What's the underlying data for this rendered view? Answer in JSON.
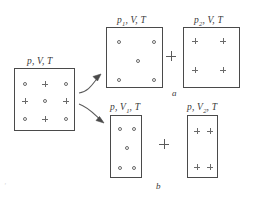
{
  "figure": {
    "kind": "physics-diagram",
    "background_color": "#ffffff",
    "line_color": "#4a4a4a",
    "particle_color": "#6a6a6a",
    "case_labels": [
      {
        "id": "a",
        "text": "a",
        "x": 172,
        "y": 93
      },
      {
        "id": "b",
        "text": "b",
        "x": 156,
        "y": 186
      }
    ],
    "operators": [
      {
        "id": "top-plus",
        "symbol": "+",
        "x": 171,
        "y": 56
      },
      {
        "id": "bottom-plus",
        "symbol": "+",
        "x": 164,
        "y": 144
      }
    ],
    "artifacts": [
      {
        "id": "scan-mark-left",
        "text": "'",
        "x": 4,
        "y": 186
      }
    ],
    "boxes": [
      {
        "id": "mixture",
        "label": {
          "p": "p",
          "p_sub": "",
          "v": "V",
          "v_sub": "",
          "t": "T",
          "full": "p, V, T"
        },
        "label_x": 27,
        "label_y": 56,
        "x": 14,
        "y": 68,
        "width": 61,
        "height": 63,
        "particles": [
          {
            "type": "circle",
            "x": 24,
            "y": 83
          },
          {
            "type": "plus",
            "x": 44,
            "y": 83
          },
          {
            "type": "circle",
            "x": 65,
            "y": 83
          },
          {
            "type": "plus",
            "x": 24,
            "y": 100
          },
          {
            "type": "circle",
            "x": 44,
            "y": 100
          },
          {
            "type": "plus",
            "x": 65,
            "y": 100
          },
          {
            "type": "circle",
            "x": 24,
            "y": 118
          },
          {
            "type": "plus",
            "x": 44,
            "y": 118
          },
          {
            "type": "circle",
            "x": 65,
            "y": 118
          }
        ]
      },
      {
        "id": "partial-pressure-1",
        "label": {
          "p": "p",
          "p_sub": "1",
          "v": "V",
          "v_sub": "",
          "t": "T",
          "full": "p1, V, T"
        },
        "label_x": 117,
        "label_y": 15,
        "x": 106,
        "y": 27,
        "width": 57,
        "height": 61,
        "particles": [
          {
            "type": "circle",
            "x": 118,
            "y": 41
          },
          {
            "type": "circle",
            "x": 153,
            "y": 41
          },
          {
            "type": "circle",
            "x": 137,
            "y": 60
          },
          {
            "type": "circle",
            "x": 118,
            "y": 79
          },
          {
            "type": "circle",
            "x": 153,
            "y": 79
          }
        ]
      },
      {
        "id": "partial-pressure-2",
        "label": {
          "p": "p",
          "p_sub": "2",
          "v": "V",
          "v_sub": "",
          "t": "T",
          "full": "p2, V, T"
        },
        "label_x": 194,
        "label_y": 15,
        "x": 183,
        "y": 27,
        "width": 57,
        "height": 61,
        "particles": [
          {
            "type": "plus",
            "x": 199,
            "y": 45
          },
          {
            "type": "plus",
            "x": 227,
            "y": 45
          },
          {
            "type": "plus",
            "x": 199,
            "y": 74
          },
          {
            "type": "plus",
            "x": 227,
            "y": 74
          }
        ]
      },
      {
        "id": "partial-volume-1",
        "label": {
          "p": "p",
          "p_sub": "",
          "v": "V",
          "v_sub": "1",
          "t": "T",
          "full": "p, V1, T"
        },
        "label_x": 110,
        "label_y": 103,
        "x": 110,
        "y": 115,
        "width": 32,
        "height": 63,
        "particles": [
          {
            "type": "circle",
            "x": 119,
            "y": 128
          },
          {
            "type": "circle",
            "x": 133,
            "y": 128
          },
          {
            "type": "circle",
            "x": 126,
            "y": 147
          },
          {
            "type": "circle",
            "x": 119,
            "y": 167
          },
          {
            "type": "circle",
            "x": 133,
            "y": 167
          }
        ]
      },
      {
        "id": "partial-volume-2",
        "label": {
          "p": "p",
          "p_sub": "",
          "v": "V",
          "v_sub": "2",
          "t": "T",
          "full": "p, V2, T"
        },
        "label_x": 187,
        "label_y": 103,
        "x": 187,
        "y": 115,
        "width": 31,
        "height": 63,
        "particles": [
          {
            "type": "plus",
            "x": 196,
            "y": 130
          },
          {
            "type": "plus",
            "x": 209,
            "y": 130
          },
          {
            "type": "plus",
            "x": 196,
            "y": 166
          },
          {
            "type": "plus",
            "x": 209,
            "y": 166
          }
        ]
      }
    ],
    "arrows": [
      {
        "id": "arrow-to-case-a",
        "path": "M 79 93 C 88 92 92 84 100 75",
        "tip": "M 100 75 L 94 77 L 98 81 Z"
      },
      {
        "id": "arrow-to-case-b",
        "path": "M 79 104 C 88 107 94 114 103 122",
        "tip": "M 104 123 L 97 121 L 100 117 Z"
      }
    ]
  }
}
